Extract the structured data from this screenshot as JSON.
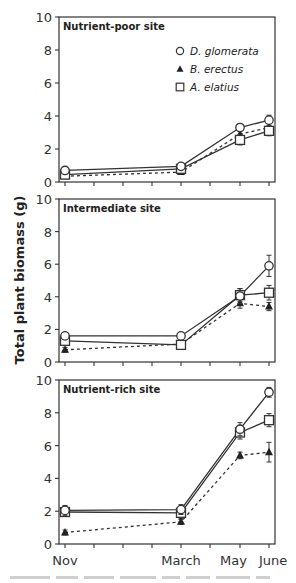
{
  "chart_data": {
    "type": "line",
    "title": "",
    "ylabel": "Total plant biomass (g)",
    "xlabel": "",
    "x": [
      "Nov",
      "March",
      "May",
      "June"
    ],
    "x_month_index": [
      0,
      4,
      6,
      7
    ],
    "x_tick_count": 8,
    "x_tick_labels": [
      {
        "label": "Nov",
        "index": 0
      },
      {
        "label": "March",
        "index": 4
      },
      {
        "label": "May",
        "index": 6
      },
      {
        "label": "June",
        "index": 7
      }
    ],
    "ylim": [
      0,
      10
    ],
    "yticks": [
      0,
      2,
      4,
      6,
      8,
      10
    ],
    "grid": false,
    "legend": {
      "position": "upper right of top panel",
      "entries": [
        {
          "label": "D. glomerata",
          "marker": "open-circle",
          "line": "solid"
        },
        {
          "label": "B. erectus",
          "marker": "filled-triangle",
          "line": "dashed"
        },
        {
          "label": "A. elatius",
          "marker": "open-square",
          "line": "solid"
        }
      ]
    },
    "panels": [
      {
        "title": "Nutrient-poor site",
        "series": [
          {
            "name": "D. glomerata",
            "values": [
              0.7,
              0.95,
              3.3,
              3.75
            ],
            "err": [
              0.1,
              0.15,
              0.2,
              0.3
            ]
          },
          {
            "name": "B. erectus",
            "values": [
              0.35,
              0.6,
              2.9,
              3.3
            ],
            "err": [
              0.1,
              0.1,
              0.2,
              0.3
            ]
          },
          {
            "name": "A. elatius",
            "values": [
              0.45,
              0.8,
              2.55,
              3.1
            ],
            "err": [
              0.2,
              0.2,
              0.3,
              0.3
            ]
          }
        ]
      },
      {
        "title": "Intermediate site",
        "series": [
          {
            "name": "D. glomerata",
            "values": [
              1.6,
              1.6,
              4.05,
              5.9
            ],
            "err": [
              0.15,
              0.15,
              0.45,
              0.65
            ]
          },
          {
            "name": "B. erectus",
            "values": [
              0.75,
              1.1,
              3.6,
              3.4
            ],
            "err": [
              0.15,
              0.15,
              0.3,
              0.25
            ]
          },
          {
            "name": "A. elatius",
            "values": [
              1.3,
              1.05,
              4.1,
              4.25
            ],
            "err": [
              0.2,
              0.2,
              0.4,
              0.45
            ]
          }
        ]
      },
      {
        "title": "Nutrient-rich site",
        "series": [
          {
            "name": "D. glomerata",
            "values": [
              2.05,
              2.1,
              7.0,
              9.25
            ],
            "err": [
              0.3,
              0.3,
              0.4,
              0.3
            ]
          },
          {
            "name": "B. erectus",
            "values": [
              0.7,
              1.35,
              5.4,
              5.6
            ],
            "err": [
              0.15,
              0.15,
              0.2,
              0.6
            ]
          },
          {
            "name": "A. elatius",
            "values": [
              1.95,
              1.9,
              6.8,
              7.55
            ],
            "err": [
              0.25,
              0.35,
              0.4,
              0.4
            ]
          }
        ]
      }
    ]
  },
  "layout": {
    "plot_left": 59,
    "plot_right": 275,
    "tick_x": [
      65,
      94,
      123,
      152,
      181,
      210,
      240,
      269
    ],
    "panels_y": [
      [
        17,
        182
      ],
      [
        199,
        362
      ],
      [
        380,
        544
      ]
    ],
    "legend": {
      "x": 180,
      "y": [
        51,
        69,
        87
      ]
    }
  },
  "colors": {
    "axis": "#333333",
    "line": "#333333",
    "marker_fill": "#ffffff",
    "triangle_fill": "#222222"
  }
}
